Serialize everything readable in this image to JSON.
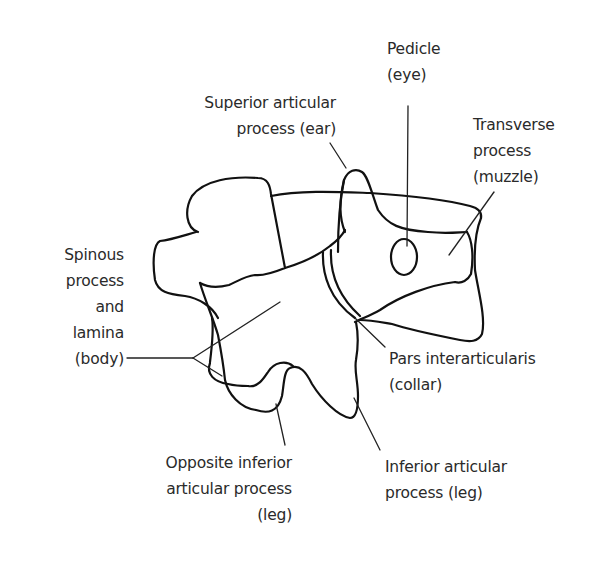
{
  "diagram": {
    "colors": {
      "background": "#ffffff",
      "outline": "#111111",
      "text": "#2a2a2a"
    },
    "labels": {
      "pedicle": {
        "line1": "Pedicle",
        "line2": "(eye)"
      },
      "superior_articular": {
        "line1": "Superior articular",
        "line2": "process (ear)"
      },
      "transverse": {
        "line1": "Transverse",
        "line2": "process",
        "line3": "(muzzle)"
      },
      "spinous": {
        "line1": "Spinous",
        "line2": "process",
        "line3": "and",
        "line4": "lamina",
        "line5": "(body)"
      },
      "pars": {
        "line1": "Pars interarticularis",
        "line2": "(collar)"
      },
      "opposite_inferior": {
        "line1": "Opposite inferior",
        "line2": "articular process",
        "line3": "(leg)"
      },
      "inferior_articular": {
        "line1": "Inferior articular",
        "line2": "process (leg)"
      }
    }
  }
}
